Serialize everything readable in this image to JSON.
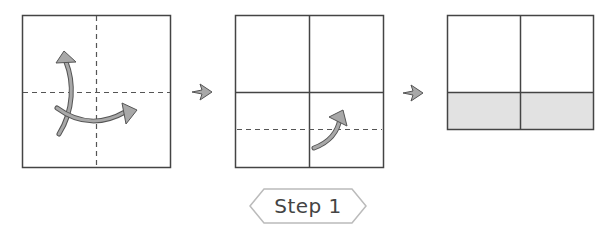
{
  "diagram": {
    "type": "origami-folding-step",
    "panels": [
      {
        "name": "panel-1",
        "description": "Square with dashed center crease lines, fold arrows up and right"
      },
      {
        "name": "panel-2",
        "description": "Square divided into quarters, dashed fold line in lower half, curved arrow upward"
      },
      {
        "name": "panel-3",
        "description": "Rectangle divided into quarters with shaded bottom strip"
      }
    ],
    "step_label": "Step 1",
    "colors": {
      "line": "#444444",
      "arrow_fill": "#a8a8a8",
      "arrow_stroke": "#555555",
      "shade": "#e2e2e2",
      "badge_stroke": "#bbbbbb"
    }
  }
}
